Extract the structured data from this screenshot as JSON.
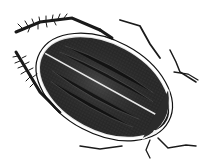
{
  "image": {
    "subject": "Engraving of a diving water beetle, dorsal view",
    "style": "black-and-white stippled engraving",
    "colors": {
      "background": "#ffffff",
      "body_dark": "#1a1a1a",
      "body_mid": "#3a3a3a",
      "highlight": "#f2f2f2",
      "line": "#111111"
    }
  }
}
